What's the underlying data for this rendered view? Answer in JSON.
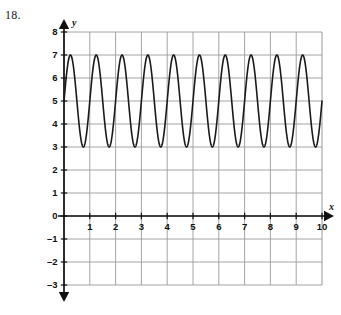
{
  "problem": {
    "number": "18."
  },
  "chart_data": {
    "type": "line",
    "title": "",
    "xlabel": "x",
    "ylabel": "y",
    "xlim": [
      0,
      10
    ],
    "ylim": [
      -3,
      8
    ],
    "grid": true,
    "legend": "none",
    "x_ticks": [
      "1",
      "2",
      "3",
      "4",
      "5",
      "6",
      "7",
      "8",
      "9",
      "10"
    ],
    "x_tick_values": [
      1,
      2,
      3,
      4,
      5,
      6,
      7,
      8,
      9,
      10
    ],
    "y_ticks": [
      "8",
      "7",
      "6",
      "5",
      "4",
      "3",
      "2",
      "1",
      "0",
      "-1",
      "-2",
      "-3"
    ],
    "y_tick_values": [
      8,
      7,
      6,
      5,
      4,
      3,
      2,
      1,
      0,
      -1,
      -2,
      -3
    ],
    "origin_label": "0",
    "series": [
      {
        "name": "sinusoid",
        "function": "y = 2 sin(2πx) + 5",
        "amplitude": 2,
        "period": 1,
        "frequency": 10,
        "midline": 5,
        "max": 7,
        "min": 3,
        "phase_shift": 0,
        "color": "#1a1a1a",
        "line_width": 1.6,
        "x_start": 0,
        "x_end": 10,
        "y_at_x0": 5,
        "peak_x_values": [
          0.25,
          1.25,
          2.25,
          3.25,
          4.25,
          5.25,
          6.25,
          7.25,
          8.25,
          9.25
        ],
        "trough_x_values": [
          0.75,
          1.75,
          2.75,
          3.75,
          4.75,
          5.75,
          6.75,
          7.75,
          8.75,
          9.75
        ]
      }
    ],
    "axis_color": "#111111",
    "grid_color": "#9a9a9a",
    "background": "#ffffff"
  }
}
